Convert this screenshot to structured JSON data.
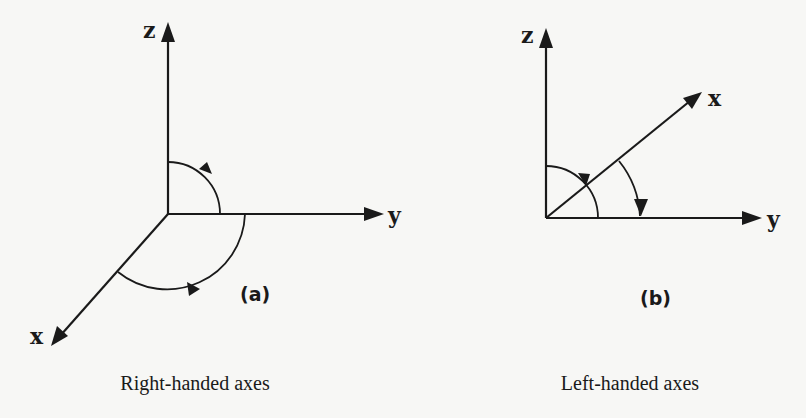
{
  "figure": {
    "panel_a": {
      "axis_labels": {
        "z": "z",
        "y": "y",
        "x": "x"
      },
      "tag": "(a)",
      "caption": "Right-handed axes"
    },
    "panel_b": {
      "axis_labels": {
        "z": "z",
        "y": "y",
        "x": "x"
      },
      "tag": "(b)",
      "caption": "Left-handed axes"
    },
    "colors": {
      "ink": "#1a1a1a",
      "background": "#f7f7f5"
    }
  }
}
